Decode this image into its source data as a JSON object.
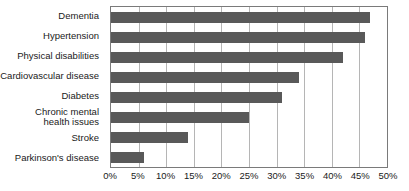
{
  "chart_data": {
    "type": "bar",
    "orientation": "horizontal",
    "title": "",
    "xlabel": "",
    "ylabel": "",
    "categories": [
      "Dementia",
      "Hypertension",
      "Physical disabilities",
      "Cardiovascular disease",
      "Diabetes",
      "Chronic mental\nhealth issues",
      "Stroke",
      "Parkinson's disease"
    ],
    "values": [
      47,
      46,
      42,
      34,
      31,
      25,
      14,
      6
    ],
    "value_suffix": "%",
    "xlim": [
      0,
      50
    ],
    "xticks": [
      0,
      5,
      10,
      15,
      20,
      25,
      30,
      35,
      40,
      45,
      50
    ],
    "xtick_labels": [
      "0%",
      "5%",
      "10%",
      "15%",
      "20%",
      "25%",
      "30%",
      "35%",
      "40%",
      "45%",
      "50%"
    ],
    "grid": "vertical",
    "legend": "none",
    "bar_color": "#595959",
    "gridline_color": "#b5b5b5",
    "axis_color": "#7a7a7a",
    "background_color": "#ffffff"
  }
}
